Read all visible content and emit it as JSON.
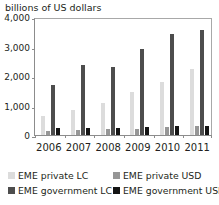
{
  "chart_data": {
    "type": "bar",
    "title": "billions of US dollars",
    "xlabel": "",
    "ylabel": "billions of US dollars",
    "ylim": [
      0,
      4000
    ],
    "yticks": [
      "0",
      "1,000",
      "2,000",
      "3,000",
      "4,000"
    ],
    "ytick_values": [
      0,
      1000,
      2000,
      3000,
      4000
    ],
    "grid": false,
    "legend_position": "bottom",
    "categories": [
      "2006",
      "2007",
      "2008",
      "2009",
      "2010",
      "2011"
    ],
    "series": [
      {
        "name": "EME private LC",
        "color": "#dcdcdc",
        "values": [
          650,
          860,
          1100,
          1450,
          1800,
          2250
        ]
      },
      {
        "name": "EME private USD",
        "color": "#969696",
        "values": [
          150,
          180,
          190,
          215,
          255,
          320
        ]
      },
      {
        "name": "EME government LC",
        "color": "#4d4d4d",
        "values": [
          1700,
          2370,
          2320,
          2930,
          3410,
          3570
        ]
      },
      {
        "name": "EME government USD",
        "color": "#141414",
        "values": [
          240,
          235,
          245,
          275,
          300,
          320
        ]
      }
    ]
  },
  "legend": {
    "items": [
      {
        "label": "EME private LC",
        "color": "#dcdcdc",
        "swatch_name": "legend-swatch-eme-private-lc"
      },
      {
        "label": "EME private USD",
        "color": "#969696",
        "swatch_name": "legend-swatch-eme-private-usd"
      },
      {
        "label": "EME government LC",
        "color": "#4d4d4d",
        "swatch_name": "legend-swatch-eme-government-lc"
      },
      {
        "label": "EME government USD",
        "color": "#141414",
        "swatch_name": "legend-swatch-eme-government-usd"
      }
    ]
  }
}
